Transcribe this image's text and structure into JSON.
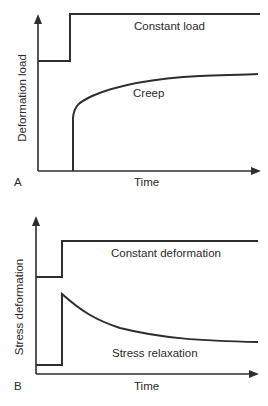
{
  "panels": [
    {
      "letter": "A",
      "y_label": "Deformation load",
      "x_label": "Time",
      "upper_curve_label": "Constant load",
      "lower_curve_label": "Creep"
    },
    {
      "letter": "B",
      "y_label": "Stress deformation",
      "x_label": "Time",
      "upper_curve_label": "Constant deformation",
      "lower_curve_label": "Stress relaxation"
    }
  ],
  "colors": {
    "line": "#2e2e2e",
    "background": "#ffffff"
  }
}
